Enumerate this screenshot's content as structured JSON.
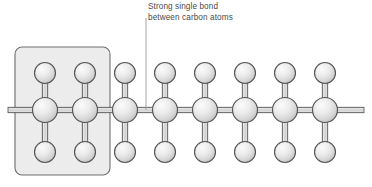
{
  "diagram": {
    "type": "molecular-structure",
    "annotation": {
      "line1": "Strong single bond",
      "line2": "between carbon atoms",
      "full_text": "Strong single bond\nbetween carbon atoms",
      "leader_line": {
        "x": 146,
        "y_start": 18,
        "y_end": 110,
        "color": "#9a9a9a"
      }
    },
    "highlight_box": {
      "label": "repeat-unit-highlight",
      "x": 15,
      "y": 47,
      "width": 95,
      "height": 128,
      "corner_radius": 7,
      "fill": "#ececec",
      "stroke": "#6e6e6e"
    },
    "colors": {
      "atom_fill_light": "#f4f4f4",
      "atom_fill_mid": "#d9d9d9",
      "atom_fill_dark": "#b6b6b6",
      "atom_stroke": "#555555",
      "bond_fill": "#d7d7d7",
      "bond_stroke": "#5a5a5a",
      "background": "#ffffff",
      "text": "#4a4a4a"
    },
    "geometry": {
      "backbone_y": 110,
      "hydrogen_top_y": 73,
      "hydrogen_bottom_y": 152,
      "carbon_radius": 12.5,
      "hydrogen_radius": 10.5,
      "carbon_x_start": 45,
      "carbon_spacing": 40,
      "stub_left_x": 8,
      "stub_right_x": 364
    },
    "carbon_atoms": [
      {
        "id": "C1",
        "x": 45,
        "y": 110,
        "element": "C"
      },
      {
        "id": "C2",
        "x": 85,
        "y": 110,
        "element": "C"
      },
      {
        "id": "C3",
        "x": 125,
        "y": 110,
        "element": "C"
      },
      {
        "id": "C4",
        "x": 165,
        "y": 110,
        "element": "C"
      },
      {
        "id": "C5",
        "x": 205,
        "y": 110,
        "element": "C"
      },
      {
        "id": "C6",
        "x": 245,
        "y": 110,
        "element": "C"
      },
      {
        "id": "C7",
        "x": 285,
        "y": 110,
        "element": "C"
      },
      {
        "id": "C8",
        "x": 325,
        "y": 110,
        "element": "C"
      }
    ],
    "hydrogen_top": [
      {
        "id": "H1t",
        "x": 45,
        "y": 73,
        "element": "H"
      },
      {
        "id": "H2t",
        "x": 85,
        "y": 73,
        "element": "H"
      },
      {
        "id": "H3t",
        "x": 125,
        "y": 73,
        "element": "H"
      },
      {
        "id": "H4t",
        "x": 165,
        "y": 73,
        "element": "H"
      },
      {
        "id": "H5t",
        "x": 205,
        "y": 73,
        "element": "H"
      },
      {
        "id": "H6t",
        "x": 245,
        "y": 73,
        "element": "H"
      },
      {
        "id": "H7t",
        "x": 285,
        "y": 73,
        "element": "H"
      },
      {
        "id": "H8t",
        "x": 325,
        "y": 73,
        "element": "H"
      }
    ],
    "hydrogen_bottom": [
      {
        "id": "H1b",
        "x": 45,
        "y": 152,
        "element": "H"
      },
      {
        "id": "H2b",
        "x": 85,
        "y": 152,
        "element": "H"
      },
      {
        "id": "H3b",
        "x": 125,
        "y": 152,
        "element": "H"
      },
      {
        "id": "H4b",
        "x": 165,
        "y": 152,
        "element": "H"
      },
      {
        "id": "H5b",
        "x": 205,
        "y": 152,
        "element": "H"
      },
      {
        "id": "H6b",
        "x": 245,
        "y": 152,
        "element": "H"
      },
      {
        "id": "H7b",
        "x": 285,
        "y": 152,
        "element": "H"
      },
      {
        "id": "H8b",
        "x": 325,
        "y": 152,
        "element": "H"
      }
    ],
    "counts": {
      "carbon_atoms": 8,
      "hydrogen_top": 8,
      "hydrogen_bottom": 8
    }
  }
}
